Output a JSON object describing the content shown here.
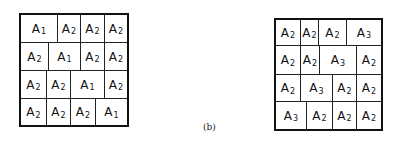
{
  "caption": "(b)",
  "grids": [
    {
      "id": "a",
      "rows": [
        [
          "A1",
          "A2",
          "A2",
          "A2"
        ],
        [
          "A2",
          "A1",
          "A2",
          "A2"
        ],
        [
          "A2",
          "A2",
          "A1",
          "A2"
        ],
        [
          "A2",
          "A2",
          "A2",
          "A1"
        ]
      ]
    },
    {
      "id": "b",
      "rows": [
        [
          "A2",
          "A2",
          "A2",
          "A3"
        ],
        [
          "A2",
          "A2",
          "A3",
          "A2"
        ],
        [
          "A2",
          "A3",
          "A2",
          "A2"
        ],
        [
          "A3",
          "A2",
          "A2",
          "A2"
        ]
      ]
    }
  ]
}
